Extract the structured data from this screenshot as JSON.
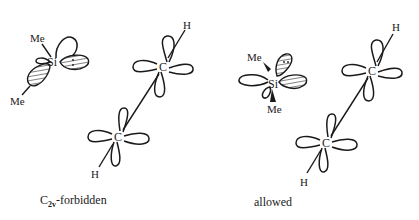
{
  "diagrams": [
    {
      "id": "left",
      "caption_main": "C",
      "caption_sub": "2v",
      "caption_rest": "-forbidden",
      "silylene": {
        "atom": "Si",
        "substituent_top": "Me",
        "substituent_bottom": "Me"
      },
      "alkene": {
        "atom_upper": "C",
        "atom_lower": "C",
        "h_upper": "H",
        "h_lower": "H"
      }
    },
    {
      "id": "right",
      "caption": "allowed",
      "silylene": {
        "atom": "Si",
        "substituent_top": "Me",
        "substituent_bottom": "Me"
      },
      "alkene": {
        "atom_upper": "C",
        "atom_lower": "C",
        "h_upper": "H",
        "h_lower": "H"
      }
    }
  ]
}
